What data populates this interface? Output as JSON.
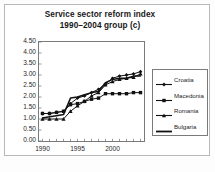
{
  "figure": {
    "background_color": "#fdfdfd",
    "frame_color": "#b9b9b9",
    "axis_color": "#7a7a7a",
    "text_color": "#1a1a1a"
  },
  "title": {
    "line1": "Service sector reform index",
    "line2": "1990–2004 group (c)"
  },
  "caption": {
    "text": ""
  },
  "chart_data": {
    "type": "line",
    "title": "Service sector reform index 1990–2004 group (c)",
    "subtitle": "1990–2004 group (c)",
    "xlabel": "",
    "ylabel": "",
    "x": [
      1990,
      1991,
      1992,
      1993,
      1994,
      1995,
      1996,
      1997,
      1998,
      1999,
      2000,
      2001,
      2002,
      2003,
      2004
    ],
    "xlim": [
      1989.5,
      2004.5
    ],
    "xticks": [
      1990,
      1995,
      2000
    ],
    "xtick_labels": [
      "1990",
      "1995",
      "2000"
    ],
    "ylim": [
      0.0,
      4.5
    ],
    "yticks": [
      0.0,
      0.5,
      1.0,
      1.5,
      2.0,
      2.5,
      3.0,
      3.5,
      4.0,
      4.5
    ],
    "ytick_labels": [
      "0.00",
      "0.50",
      "1.00",
      "1.50",
      "2.00",
      "2.50",
      "3.00",
      "3.50",
      "4.00",
      "4.50"
    ],
    "grid": false,
    "legend_position": "right",
    "series": [
      {
        "name": "Croatia",
        "marker": "diamond",
        "color": "#111111",
        "values": [
          1.25,
          1.25,
          1.3,
          1.35,
          1.7,
          1.95,
          2.05,
          2.2,
          2.35,
          2.6,
          2.85,
          2.95,
          3.0,
          3.05,
          3.15
        ]
      },
      {
        "name": "Macedonia",
        "marker": "square",
        "color": "#111111",
        "values": [
          1.25,
          1.25,
          1.3,
          1.35,
          1.65,
          1.7,
          1.8,
          1.9,
          1.95,
          2.15,
          2.15,
          2.15,
          2.15,
          2.2,
          2.2
        ]
      },
      {
        "name": "Romania",
        "marker": "triangle",
        "color": "#111111",
        "values": [
          1.0,
          1.0,
          1.0,
          1.0,
          1.35,
          1.6,
          1.8,
          2.05,
          2.2,
          2.55,
          2.7,
          2.8,
          2.85,
          2.9,
          3.05
        ]
      },
      {
        "name": "Bulgaria",
        "marker": "none",
        "color": "#111111",
        "values": [
          1.05,
          1.1,
          1.15,
          1.2,
          1.95,
          2.0,
          2.1,
          2.2,
          2.25,
          2.65,
          2.8,
          2.85,
          2.85,
          2.95,
          2.95
        ]
      }
    ]
  },
  "legend": {
    "items": [
      {
        "label": "Croatia",
        "marker": "diamond-marker"
      },
      {
        "label": "Macedonia",
        "marker": "square-marker"
      },
      {
        "label": "Romania",
        "marker": "triangle-marker"
      },
      {
        "label": "Bulgaria",
        "marker": "line-marker"
      }
    ]
  }
}
